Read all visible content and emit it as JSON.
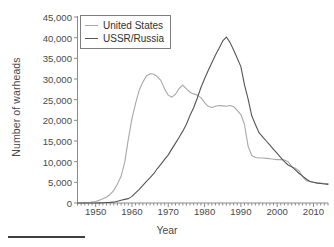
{
  "chart_data": {
    "type": "line",
    "title": "",
    "xlabel": "Year",
    "ylabel": "Number of warheads",
    "xlim": [
      1945,
      2014
    ],
    "ylim": [
      0,
      45000
    ],
    "grid": false,
    "legend_position": "top-left",
    "xticks": [
      1950,
      1960,
      1970,
      1980,
      1990,
      2000,
      2010
    ],
    "xtick_labels": [
      "1950",
      "1960",
      "1970",
      "1980",
      "1990",
      "2000",
      "2010"
    ],
    "xminor_tick_interval": 1,
    "yticks": [
      0,
      5000,
      10000,
      15000,
      20000,
      25000,
      30000,
      35000,
      40000,
      45000
    ],
    "ytick_labels": [
      "0",
      "5,000",
      "10,000",
      "15,000",
      "20,000",
      "25,000",
      "30,000",
      "35,000",
      "40,000",
      "45,000"
    ],
    "series": [
      {
        "name": "United States",
        "color": "#a8a8a8",
        "x": [
          1945,
          1946,
          1947,
          1948,
          1949,
          1950,
          1951,
          1952,
          1953,
          1954,
          1955,
          1956,
          1957,
          1958,
          1959,
          1960,
          1961,
          1962,
          1963,
          1964,
          1965,
          1966,
          1967,
          1968,
          1969,
          1970,
          1971,
          1972,
          1973,
          1974,
          1975,
          1976,
          1977,
          1978,
          1979,
          1980,
          1981,
          1982,
          1983,
          1984,
          1985,
          1986,
          1987,
          1988,
          1989,
          1990,
          1991,
          1992,
          1993,
          1994,
          1995,
          1996,
          1997,
          1998,
          1999,
          2000,
          2001,
          2002,
          2003,
          2004,
          2005,
          2006,
          2007,
          2008,
          2009,
          2010,
          2011,
          2012,
          2013,
          2014
        ],
        "y": [
          6,
          11,
          32,
          110,
          235,
          369,
          640,
          1005,
          1436,
          2063,
          3057,
          4618,
          6444,
          9822,
          15468,
          20434,
          24111,
          27297,
          29249,
          30751,
          31255,
          31139,
          30600,
          29600,
          27600,
          26100,
          25600,
          26300,
          27700,
          28500,
          27600,
          26800,
          26400,
          26100,
          25500,
          24300,
          23400,
          23100,
          23400,
          23600,
          23500,
          23400,
          23600,
          23300,
          22400,
          21400,
          19000,
          13700,
          11500,
          11000,
          10900,
          10900,
          10800,
          10700,
          10600,
          10500,
          10500,
          10400,
          10000,
          8800,
          8400,
          7800,
          6400,
          5400,
          5200,
          5000,
          4900,
          4800,
          4700,
          4700
        ]
      },
      {
        "name": "USSR/Russia",
        "color": "#555555",
        "x": [
          1945,
          1946,
          1947,
          1948,
          1949,
          1950,
          1951,
          1952,
          1953,
          1954,
          1955,
          1956,
          1957,
          1958,
          1959,
          1960,
          1961,
          1962,
          1963,
          1964,
          1965,
          1966,
          1967,
          1968,
          1969,
          1970,
          1971,
          1972,
          1973,
          1974,
          1975,
          1976,
          1977,
          1978,
          1979,
          1980,
          1981,
          1982,
          1983,
          1984,
          1985,
          1986,
          1987,
          1988,
          1989,
          1990,
          1991,
          1992,
          1993,
          1994,
          1995,
          1996,
          1997,
          1998,
          1999,
          2000,
          2001,
          2002,
          2003,
          2004,
          2005,
          2006,
          2007,
          2008,
          2009,
          2010,
          2011,
          2012,
          2013,
          2014
        ],
        "y": [
          0,
          0,
          0,
          0,
          1,
          5,
          25,
          50,
          120,
          150,
          200,
          426,
          660,
          869,
          1060,
          1605,
          2471,
          3322,
          4238,
          5221,
          6129,
          7089,
          8339,
          9399,
          10538,
          11643,
          13092,
          14478,
          15915,
          17385,
          19055,
          21205,
          23044,
          25393,
          27935,
          30062,
          32049,
          33952,
          35804,
          37431,
          39197,
          40159,
          38859,
          37000,
          35000,
          33000,
          28595,
          25155,
          21101,
          19008,
          17000,
          16000,
          15000,
          14000,
          13000,
          12000,
          11000,
          10000,
          9200,
          8800,
          8000,
          7200,
          6500,
          5800,
          5200,
          5000,
          4800,
          4700,
          4600,
          4500
        ]
      }
    ]
  },
  "annotations": {
    "bottom_rule": ""
  }
}
